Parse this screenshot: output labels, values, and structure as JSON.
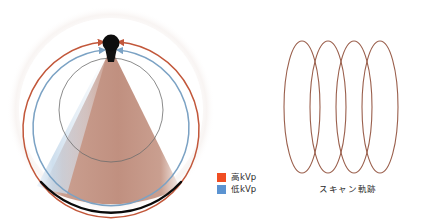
{
  "figure": {
    "title_visible": false,
    "panels": [
      {
        "name": "gantry-cross-section",
        "description": "CT gantry cross section with x-ray tube, dual-energy fan beams and detector arc"
      },
      {
        "name": "scan-trajectory",
        "description": "Helical scan trajectory shown as four overlapping ellipses"
      }
    ]
  },
  "legend": {
    "items": [
      {
        "label": "高kVp",
        "color": "#f04e23",
        "icon": "square-swatch-icon"
      },
      {
        "label": "低kVp",
        "color": "#5b93d1",
        "icon": "square-swatch-icon"
      }
    ]
  },
  "trajectory": {
    "caption": "スキャン軌跡",
    "loop_count": 4
  },
  "colors": {
    "high_kvp_arc": "#c2573a",
    "low_kvp_arc": "#7ba2c4",
    "fan_fill": "#c08f7f",
    "fan_low_fill": "#cfe0ee",
    "tube": "#0d0d0d",
    "detector": "#000000",
    "fov_circle": "#6b6b6b",
    "trajectory_stroke": "#9a5f4c",
    "background": "#ffffff"
  },
  "geometry": {
    "tube_center": {
      "x": 111,
      "y": 45
    },
    "fov_radius_px": 52,
    "high_arc_radius_px": 88,
    "low_arc_radius_px": 78
  }
}
